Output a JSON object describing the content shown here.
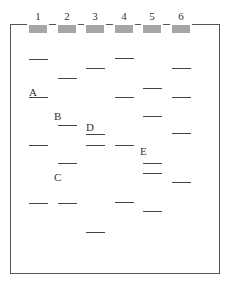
{
  "lanes": [
    {
      "label": "1",
      "x": 29
    },
    {
      "label": "2",
      "x": 58
    },
    {
      "label": "3",
      "x": 86
    },
    {
      "label": "4",
      "x": 115
    },
    {
      "label": "5",
      "x": 143
    },
    {
      "label": "6",
      "x": 172
    }
  ],
  "bands": [
    {
      "lane": 1,
      "y": 59
    },
    {
      "lane": 1,
      "y": 97
    },
    {
      "lane": 1,
      "y": 145
    },
    {
      "lane": 1,
      "y": 203
    },
    {
      "lane": 2,
      "y": 78
    },
    {
      "lane": 2,
      "y": 125
    },
    {
      "lane": 2,
      "y": 163
    },
    {
      "lane": 2,
      "y": 203
    },
    {
      "lane": 3,
      "y": 68
    },
    {
      "lane": 3,
      "y": 134
    },
    {
      "lane": 3,
      "y": 145
    },
    {
      "lane": 3,
      "y": 232
    },
    {
      "lane": 4,
      "y": 58
    },
    {
      "lane": 4,
      "y": 97
    },
    {
      "lane": 4,
      "y": 145
    },
    {
      "lane": 4,
      "y": 202
    },
    {
      "lane": 5,
      "y": 88
    },
    {
      "lane": 5,
      "y": 116
    },
    {
      "lane": 5,
      "y": 163
    },
    {
      "lane": 5,
      "y": 173
    },
    {
      "lane": 5,
      "y": 211
    },
    {
      "lane": 6,
      "y": 68
    },
    {
      "lane": 6,
      "y": 97
    },
    {
      "lane": 6,
      "y": 133
    },
    {
      "lane": 6,
      "y": 182
    }
  ],
  "band_labels": [
    {
      "text": "A",
      "x": 29,
      "y": 86
    },
    {
      "text": "B",
      "x": 54,
      "y": 110
    },
    {
      "text": "C",
      "x": 54,
      "y": 171
    },
    {
      "text": "D",
      "x": 86,
      "y": 121
    },
    {
      "text": "E",
      "x": 140,
      "y": 145
    }
  ],
  "colors": {
    "well": "#a6a6a6",
    "band": "#444444",
    "frame": "#555555"
  }
}
